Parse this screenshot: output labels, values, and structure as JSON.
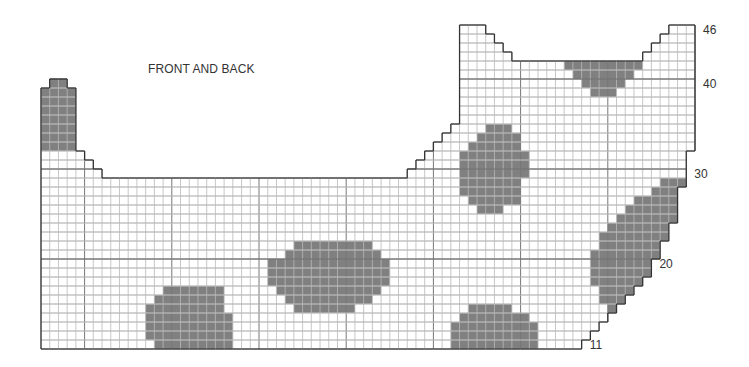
{
  "title": "FRONT AND BACK",
  "chart_data": {
    "type": "heatmap",
    "title": "FRONT AND BACK",
    "grid": {
      "origin_x": 41,
      "bottom_y": 349,
      "cell_w": 8.72,
      "cell_h": 9.0,
      "columns": 75,
      "rows": 36,
      "first_row_number": 11,
      "major_every": 10,
      "major_col_offset": 5
    },
    "colors": {
      "shade": "#808080",
      "line": "#b9b9b9",
      "major": "#777777",
      "outline": "#333333"
    },
    "row_labels": [
      {
        "row": 0,
        "label": "11"
      },
      {
        "row": 9,
        "label": "20"
      },
      {
        "row": 19,
        "label": "30"
      },
      {
        "row": 29,
        "label": "40"
      },
      {
        "row": 35,
        "label": "46"
      }
    ],
    "shape_rows": [
      [
        [
          0,
          61
        ]
      ],
      [
        [
          0,
          62
        ]
      ],
      [
        [
          0,
          63
        ]
      ],
      [
        [
          0,
          64
        ]
      ],
      [
        [
          0,
          65
        ]
      ],
      [
        [
          0,
          66
        ]
      ],
      [
        [
          0,
          67
        ]
      ],
      [
        [
          0,
          68
        ]
      ],
      [
        [
          0,
          69
        ]
      ],
      [
        [
          0,
          69
        ]
      ],
      [
        [
          0,
          70
        ]
      ],
      [
        [
          0,
          70
        ]
      ],
      [
        [
          0,
          71
        ]
      ],
      [
        [
          0,
          71
        ]
      ],
      [
        [
          0,
          72
        ]
      ],
      [
        [
          0,
          72
        ]
      ],
      [
        [
          0,
          72
        ]
      ],
      [
        [
          0,
          72
        ]
      ],
      [
        [
          0,
          73
        ]
      ],
      [
        [
          0,
          6
        ],
        [
          42,
          73
        ]
      ],
      [
        [
          0,
          5
        ],
        [
          43,
          73
        ]
      ],
      [
        [
          0,
          4
        ],
        [
          44,
          73
        ]
      ],
      [
        [
          0,
          3
        ],
        [
          45,
          74
        ]
      ],
      [
        [
          0,
          3
        ],
        [
          46,
          74
        ]
      ],
      [
        [
          0,
          3
        ],
        [
          47,
          74
        ]
      ],
      [
        [
          0,
          3
        ],
        [
          48,
          74
        ]
      ],
      [
        [
          0,
          3
        ],
        [
          48,
          74
        ]
      ],
      [
        [
          0,
          3
        ],
        [
          48,
          74
        ]
      ],
      [
        [
          0,
          3
        ],
        [
          48,
          74
        ]
      ],
      [
        [
          1,
          2
        ],
        [
          48,
          74
        ]
      ],
      [
        [
          48,
          74
        ]
      ],
      [
        [
          48,
          74
        ]
      ],
      [
        [
          48,
          53
        ],
        [
          69,
          74
        ]
      ],
      [
        [
          48,
          52
        ],
        [
          70,
          74
        ]
      ],
      [
        [
          48,
          51
        ],
        [
          71,
          74
        ]
      ],
      [
        [
          48,
          50
        ],
        [
          72,
          74
        ]
      ]
    ],
    "shaded": [
      {
        "name": "tower-patch",
        "rows": {
          "22": [
            0,
            3
          ],
          "23": [
            0,
            3
          ],
          "24": [
            0,
            3
          ],
          "25": [
            0,
            3
          ],
          "26": [
            0,
            3
          ],
          "27": [
            0,
            3
          ],
          "28": [
            0,
            3
          ],
          "29": [
            1,
            2
          ]
        }
      },
      {
        "name": "spot-bottom-left",
        "rows": {
          "0": [
            13,
            21
          ],
          "1": [
            12,
            21
          ],
          "2": [
            12,
            21
          ],
          "3": [
            12,
            21
          ],
          "4": [
            12,
            20
          ],
          "5": [
            13,
            20
          ],
          "6": [
            14,
            20
          ]
        }
      },
      {
        "name": "spot-center",
        "rows": {
          "4": [
            29,
            35
          ],
          "5": [
            28,
            37
          ],
          "6": [
            27,
            38
          ],
          "7": [
            26,
            39
          ],
          "8": [
            26,
            39
          ],
          "9": [
            26,
            39
          ],
          "10": [
            28,
            38
          ],
          "11": [
            29,
            37
          ]
        }
      },
      {
        "name": "spot-bottom-right",
        "rows": {
          "0": [
            47,
            56
          ],
          "1": [
            47,
            56
          ],
          "2": [
            47,
            56
          ],
          "3": [
            48,
            55
          ],
          "4": [
            49,
            53
          ]
        }
      },
      {
        "name": "spot-upper-middle",
        "rows": {
          "15": [
            50,
            52
          ],
          "16": [
            49,
            54
          ],
          "17": [
            48,
            54
          ],
          "18": [
            48,
            54
          ],
          "19": [
            48,
            55
          ],
          "20": [
            48,
            55
          ],
          "21": [
            48,
            55
          ],
          "22": [
            49,
            54
          ],
          "23": [
            50,
            54
          ],
          "24": [
            51,
            53
          ]
        }
      },
      {
        "name": "spot-neck",
        "rows": {
          "28": [
            63,
            65
          ],
          "29": [
            62,
            66
          ],
          "30": [
            61,
            67
          ],
          "31": [
            60,
            68
          ]
        }
      },
      {
        "name": "spot-right-edge",
        "rows": {
          "4": [
            65,
            65
          ],
          "5": [
            64,
            66
          ],
          "6": [
            64,
            67
          ],
          "7": [
            63,
            68
          ],
          "8": [
            63,
            69
          ],
          "9": [
            63,
            69
          ],
          "10": [
            63,
            70
          ],
          "11": [
            64,
            70
          ],
          "12": [
            64,
            71
          ],
          "13": [
            65,
            71
          ],
          "14": [
            66,
            72
          ],
          "15": [
            67,
            72
          ],
          "16": [
            68,
            72
          ],
          "17": [
            70,
            72
          ],
          "18": [
            71,
            73
          ]
        }
      }
    ]
  }
}
